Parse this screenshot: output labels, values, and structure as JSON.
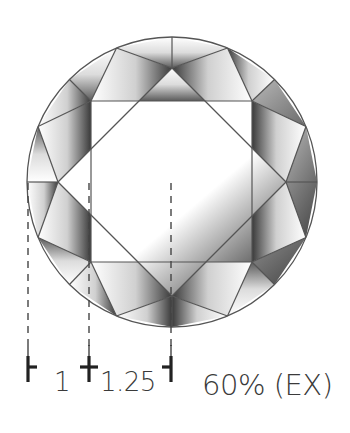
{
  "diagram": {
    "geometry": {
      "center": [
        172,
        182
      ],
      "girdle_radius": 145,
      "star_points": {
        "top": [
          172,
          68
        ],
        "right": [
          286,
          182
        ],
        "bottom": [
          172,
          296
        ],
        "left": [
          58,
          182
        ]
      },
      "table_corners": {
        "top_left": [
          91,
          101
        ],
        "top_right": [
          252,
          101
        ],
        "bottom_right": [
          252,
          262
        ],
        "bottom_left": [
          91,
          262
        ]
      }
    },
    "colors": {
      "outline": "#555555",
      "facet_dark": "#3c3c3c",
      "facet_mid": "#8a8a8a",
      "facet_light": "#ffffff",
      "text": "#3a3a3a",
      "marker": "#222222"
    },
    "measure_lines": [
      {
        "id": "girdle-edge",
        "x": 28,
        "y_start": 183,
        "y_end": 345
      },
      {
        "id": "table-edge",
        "x": 89,
        "y_start": 183,
        "y_end": 350
      },
      {
        "id": "center",
        "x": 171,
        "y_start": 183,
        "y_end": 350
      }
    ],
    "markers": [
      {
        "id": "left",
        "x": 28,
        "stub": "right"
      },
      {
        "id": "middle",
        "x": 89,
        "stub": "both"
      },
      {
        "id": "right",
        "x": 171,
        "stub": "left"
      }
    ]
  },
  "labels": {
    "segment_1": "1",
    "segment_2": "1.25",
    "table_grade": "60% (EX)"
  }
}
